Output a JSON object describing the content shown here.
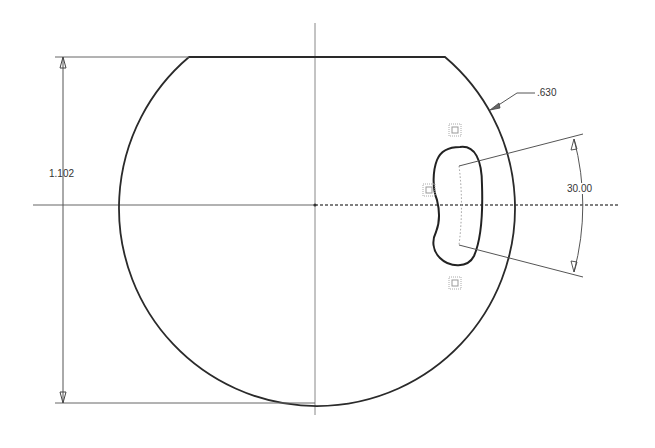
{
  "drawing": {
    "dimensions": {
      "height": "1.102",
      "radius_leader": ".630",
      "angle": "30.00"
    },
    "colors": {
      "profile": "#2a2a2a",
      "dimension": "#555555",
      "axis": "#777777",
      "constraint": "#999999"
    },
    "constraint_glyphs": [
      "constraint-icon-top",
      "constraint-icon-left",
      "constraint-icon-bottom"
    ]
  }
}
